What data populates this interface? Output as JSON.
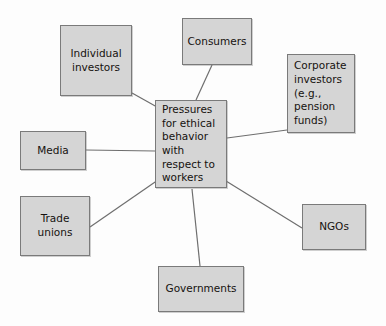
{
  "diagram": {
    "title": "Pressures for ethical behavior with respect to workers",
    "type": "hub-and-spoke stakeholder diagram",
    "background_color": "#fdfdfd",
    "node_fill_color": "#d5d5d5",
    "node_border_color": "#7a7a7a",
    "connector_color": "#6e6e6e",
    "text_color": "#16120f",
    "center": {
      "id": "center",
      "label": "Pressures\nfor ethical\nbehavior\nwith\nrespect to\nworkers",
      "x": 155,
      "y": 100,
      "width": 72,
      "height": 88
    },
    "nodes": [
      {
        "id": "individual-investors",
        "label": "Individual\ninvestors",
        "x": 60,
        "y": 25,
        "width": 72,
        "height": 71
      },
      {
        "id": "consumers",
        "label": "Consumers",
        "x": 182,
        "y": 18,
        "width": 70,
        "height": 47
      },
      {
        "id": "corporate-investors",
        "label": "Corporate\ninvestors\n(e.g.,\npension\nfunds)",
        "x": 287,
        "y": 54,
        "width": 68,
        "height": 79,
        "align": "left"
      },
      {
        "id": "media",
        "label": "Media",
        "x": 20,
        "y": 131,
        "width": 66,
        "height": 39
      },
      {
        "id": "trade-unions",
        "label": "Trade\nunions",
        "x": 20,
        "y": 196,
        "width": 70,
        "height": 60
      },
      {
        "id": "ngos",
        "label": "NGOs",
        "x": 302,
        "y": 204,
        "width": 64,
        "height": 46
      },
      {
        "id": "governments",
        "label": "Governments",
        "x": 158,
        "y": 266,
        "width": 86,
        "height": 46
      }
    ],
    "connectors": [
      {
        "id": "link-individual-investors",
        "from": "individual-investors",
        "to": "center",
        "x1": 132,
        "y1": 93,
        "x2": 157,
        "y2": 107
      },
      {
        "id": "link-consumers",
        "from": "consumers",
        "to": "center",
        "x1": 212,
        "y1": 65,
        "x2": 196,
        "y2": 100
      },
      {
        "id": "link-corporate-investors",
        "from": "corporate-investors",
        "to": "center",
        "x1": 287,
        "y1": 130,
        "x2": 227,
        "y2": 138
      },
      {
        "id": "link-media",
        "from": "media",
        "to": "center",
        "x1": 86,
        "y1": 150,
        "x2": 155,
        "y2": 151
      },
      {
        "id": "link-trade-unions",
        "from": "trade-unions",
        "to": "center",
        "x1": 90,
        "y1": 227,
        "x2": 158,
        "y2": 180
      },
      {
        "id": "link-ngos",
        "from": "ngos",
        "to": "center",
        "x1": 302,
        "y1": 228,
        "x2": 226,
        "y2": 181
      },
      {
        "id": "link-governments",
        "from": "governments",
        "to": "center",
        "x1": 200,
        "y1": 266,
        "x2": 192,
        "y2": 189
      }
    ]
  }
}
